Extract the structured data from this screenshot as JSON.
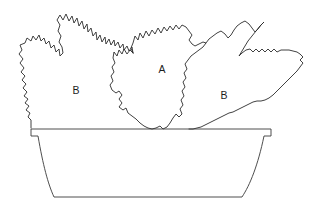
{
  "figure": {
    "background_color": "#ffffff",
    "line_color": "#2b2b2b",
    "width": 328,
    "height": 213
  },
  "labels": [
    {
      "id": "left-plant-label",
      "text": "B",
      "x": 76,
      "y": 91
    },
    {
      "id": "center-plant-label",
      "text": "A",
      "x": 162,
      "y": 70
    },
    {
      "id": "right-plant-label",
      "text": "B",
      "x": 224,
      "y": 96
    }
  ],
  "shapes": {
    "left_plant": {
      "name": "left-foliage-mass",
      "label": "B",
      "path": "M 31,128 L 31,120 L 28,117 L 30,113 L 26,110 L 29,106 L 25,103 L 28,99 L 24,96 L 27,92 L 23,88 L 26,84 L 22,80 L 25,76 L 21,72 L 24,68 L 20,63 L 23,59 L 19,54 L 22,50 L 20,45 L 25,43 L 27,38 L 31,41 L 33,36 L 36,40 L 39,35 L 41,41 L 44,38 L 46,44 L 49,41 L 51,48 L 54,45 L 56,52 L 59,49 L 60,56 L 63,53 L 62,47 L 59,42 L 61,36 L 58,31 L 60,25 L 57,20 L 60,15 L 63,20 L 66,14 L 69,21 L 72,16 L 74,23 L 77,18 L 79,26 L 82,21 L 84,29 L 87,24 L 88,32 L 91,28 L 93,36 L 96,32 L 97,40 L 100,35 L 102,42 L 105,37 L 106,44 L 109,39 L 111,45 L 114,40 L 115,46 L 118,42 L 120,48 L 123,44 L 124,50 L 127,46 L 129,51 L 132,47 L 133,53"
    },
    "center_plant": {
      "name": "center-foliage-mass",
      "label": "A",
      "path": "M 133,53 L 130,50 L 127,54 L 124,49 L 122,54 L 119,50 L 117,56 L 114,52 L 113,58 L 115,63 L 112,67 L 114,72 L 111,76 L 113,81 L 110,85 L 112,90 L 116,93 L 119,91 L 122,95 L 119,99 L 122,103 L 119,107 L 123,110 L 126,108 L 128,113 L 132,116 L 136,119 L 140,123 L 144,126 L 148,128 L 152,129 L 156,128 L 160,126 L 163,129 L 167,127 L 170,123 L 173,118 L 176,114 L 179,117 L 182,114 L 180,109 L 183,105 L 181,100 L 184,96 L 182,91 L 185,87 L 183,82 L 186,78 L 184,73 L 187,69 L 185,64 L 188,60 L 191,56 L 195,53 L 199,50 L 203,47 L 206,43 L 203,42 L 199,44 L 195,46 L 192,44 L 189,40 L 192,35 L 189,31 L 186,27 L 182,25 L 179,29 L 176,25 L 173,30 L 170,26 L 167,31 L 164,27 L 161,33 L 158,28 L 155,34 L 152,30 L 149,36 L 146,31 L 143,38 L 140,33 L 138,40 L 135,36 L 133,43 L 131,48 Z"
    },
    "right_plant": {
      "name": "right-foliage-mass",
      "label": "B",
      "path": "M 206,43 L 209,39 L 213,36 L 217,33 L 221,31 L 225,34 L 228,38 L 231,35 L 234,30 L 237,26 L 241,23 L 245,21 L 249,24 L 252,28 L 255,32 L 258,29 L 261,25 L 264,22 L 260,26 L 256,31 L 252,36 L 248,41 L 245,46 L 242,51 L 239,56 L 242,53 L 246,50 L 250,49 L 253,52 L 256,49 L 259,52 L 262,49 L 265,52 L 268,49 L 271,52 L 274,49 L 277,52 L 281,50 L 285,50 L 289,50 L 293,51 L 297,52 L 300,54 L 303,57 L 300,60 L 303,63 L 300,67 L 297,71 L 293,75 L 289,79 L 285,83 L 281,87 L 277,91 L 273,95 L 269,98 L 265,100 L 261,101 L 257,101 L 253,102 L 249,104 L 245,106 L 241,108 L 237,110 L 233,112 L 229,113 L 225,115 L 221,117 L 217,119 L 213,121 L 209,123 L 205,125 L 201,127 L 197,128 L 193,129 L 189,129"
    },
    "planter": {
      "name": "planter-box",
      "rim_left_x": 31,
      "rim_right_x": 271,
      "rim_top_y": 129,
      "rim_bottom_y": 136,
      "body_bottom_y": 197,
      "bottom_left_x": 54,
      "bottom_right_x": 242,
      "rim_path": "M 31,129 L 271,129",
      "rim_left_path": "M 31,129 L 31,136 L 38,136",
      "rim_right_path": "M 271,129 L 271,136 L 264,136",
      "body_path": "M 38,136 L 54,197 L 242,197 L 264,136",
      "body_curve_left": "M 38,136 C 43,165 48,184 54,197",
      "body_curve_right": "M 264,136 C 258,165 250,185 242,197"
    }
  }
}
